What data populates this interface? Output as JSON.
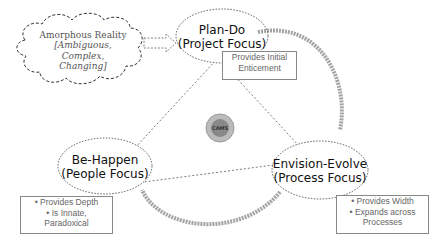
{
  "cloud": {
    "title": "Amorphous Reality",
    "subtitle_line1": "[Ambiguous, Complex,",
    "subtitle_line2": "Changing]"
  },
  "nodes": {
    "plan_do": {
      "line1": "Plan-Do",
      "line2": "(Project Focus)"
    },
    "be_happen": {
      "line1": "Be-Happen",
      "line2": "(People Focus)"
    },
    "envision_evolve": {
      "line1": "Envision-Evolve",
      "line2": "(Process Focus)"
    }
  },
  "notes": {
    "plan_do": {
      "line1": "Provides Initial",
      "line2": "Enticement"
    },
    "be_happen": {
      "items": [
        "Provides Depth",
        "Is Innate,"
      ],
      "tail": "Paradoxical"
    },
    "envision_evolve": {
      "items": [
        "Provides Width",
        "Expands across"
      ],
      "tail": "Processes"
    }
  },
  "center": {
    "label": "CAMS"
  }
}
